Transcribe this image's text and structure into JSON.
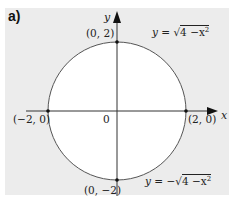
{
  "part_label": "a)",
  "axes": {
    "x_label": "x",
    "y_label": "y",
    "origin_label": "0"
  },
  "points": [
    {
      "label": "(0, 2)",
      "x": 0,
      "y": 2
    },
    {
      "label": "(0, −2)",
      "x": 0,
      "y": -2
    },
    {
      "label": "(−2, 0)",
      "x": -2,
      "y": 0
    },
    {
      "label": "(2, 0)",
      "x": 2,
      "y": 0
    }
  ],
  "equations": {
    "upper": {
      "lhs": "y = ",
      "rad": "√",
      "radicand": "4 −x",
      "exp": "2"
    },
    "lower": {
      "lhs": "y = −",
      "rad": "√",
      "radicand": "4 −x",
      "exp": "2"
    }
  },
  "colors": {
    "panel": "#ececec",
    "circle_fill": "#ffffff",
    "stroke": "#333333"
  }
}
